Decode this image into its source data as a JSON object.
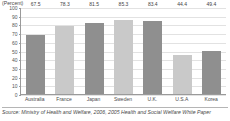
{
  "chart_data": {
    "type": "bar",
    "title": "",
    "subtitle": "",
    "unit_label": "(Percent)",
    "xlabel": "",
    "ylabel": "",
    "ylim": [
      0,
      100
    ],
    "yticks": [
      100,
      90,
      80,
      70,
      60,
      50,
      40,
      30,
      20,
      10,
      0
    ],
    "ytick_labels": [
      "100",
      "90",
      "80",
      "70",
      "60",
      "50",
      "40",
      "30",
      "20",
      "10",
      "0"
    ],
    "grid": true,
    "legend": "none",
    "categories": [
      "Australia",
      "France",
      "Japan",
      "Sweden",
      "U.K.",
      "U.S.A",
      "Korea"
    ],
    "values": [
      67.5,
      78.3,
      81.5,
      85.3,
      83.4,
      44.4,
      49.4
    ],
    "value_labels": [
      "67.5",
      "78.3",
      "81.5",
      "85.3",
      "83.4",
      "44.4",
      "49.4"
    ],
    "bar_shades": [
      "dark",
      "light",
      "dark",
      "light",
      "dark",
      "light",
      "dark"
    ]
  },
  "colors": {
    "bar_dark": "#8f8f8f",
    "bar_light": "#c9c9c9",
    "axis": "#9a9a9a",
    "grid": "#e2e2e2",
    "text": "#3f3f3f"
  },
  "source": {
    "text": "Source: Ministry of Health and Welfare, 2006, 2005 Health and Social Welfare White Paper"
  }
}
